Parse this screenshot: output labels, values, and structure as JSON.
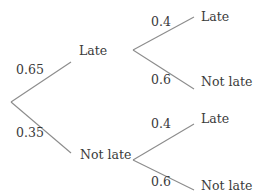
{
  "diagram": {
    "type": "probability-tree",
    "stage1": {
      "branches": [
        {
          "outcome": "Late",
          "probability": "0.65"
        },
        {
          "outcome": "Not late",
          "probability": "0.35"
        }
      ]
    },
    "stage2": {
      "after_late": {
        "branches": [
          {
            "outcome": "Late",
            "probability": "0.4"
          },
          {
            "outcome": "Not late",
            "probability": "0.6"
          }
        ]
      },
      "after_not_late": {
        "branches": [
          {
            "outcome": "Late",
            "probability": "0.4"
          },
          {
            "outcome": "Not late",
            "probability": "0.6"
          }
        ]
      }
    },
    "colors": {
      "line": "#8c8c8c",
      "text": "#3a3a3a"
    }
  }
}
